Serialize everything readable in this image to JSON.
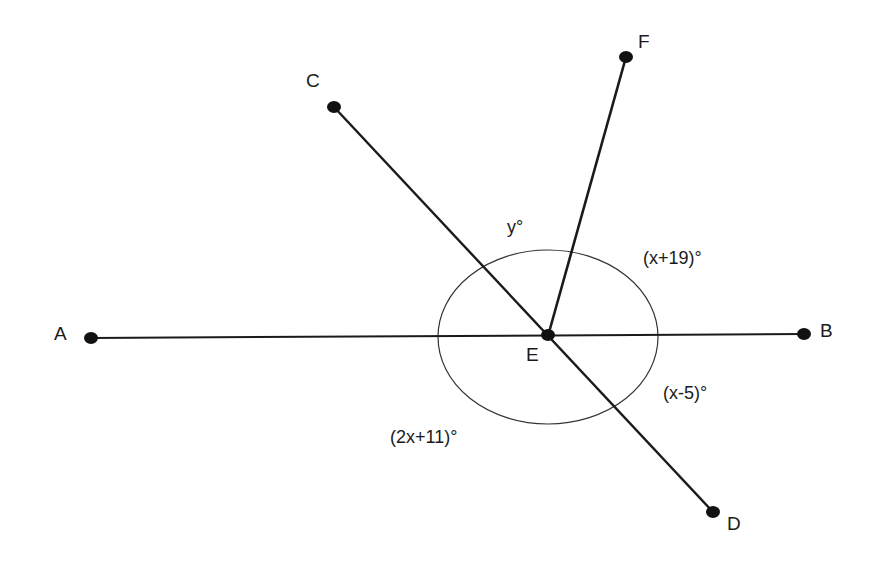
{
  "diagram": {
    "points": {
      "A": {
        "label": "A",
        "x": 91,
        "y": 338
      },
      "B": {
        "label": "B",
        "x": 804,
        "y": 334
      },
      "C": {
        "label": "C",
        "x": 334,
        "y": 107
      },
      "D": {
        "label": "D",
        "x": 713,
        "y": 512
      },
      "E": {
        "label": "E",
        "x": 548,
        "y": 336
      },
      "F": {
        "label": "F",
        "x": 626,
        "y": 57
      }
    },
    "segments": [
      [
        "A",
        "B"
      ],
      [
        "C",
        "D"
      ],
      [
        "E",
        "F"
      ]
    ],
    "angle_labels": {
      "y": "y°",
      "x_plus_19": "(x+19)°",
      "x_minus_5": "(x-5)°",
      "two_x_plus_11": "(2x+11)°"
    },
    "colors": {
      "stroke": "#1a1a1a",
      "background": "#ffffff"
    }
  }
}
